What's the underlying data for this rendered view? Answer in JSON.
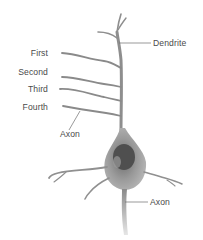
{
  "diagram": {
    "labels": {
      "first": "First",
      "second": "Second",
      "third": "Third",
      "fourth": "Fourth",
      "axon_upper": "Axon",
      "dendrite": "Dendrite",
      "axon_lower": "Axon"
    },
    "colors": {
      "background": "#ffffff",
      "cell": "#8c8c8c",
      "cell_light": "#c8c8c8",
      "nucleus": "#4e4e4e",
      "leader_line": "#6e6e6e",
      "text": "#4a4a4a"
    }
  }
}
